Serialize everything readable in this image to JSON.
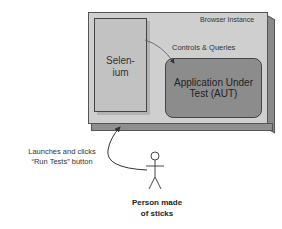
{
  "diagram": {
    "container": {
      "label": "Browser Instance"
    },
    "selenium": {
      "label": "Selen-\nium",
      "line1": "Selen-",
      "line2": "ium"
    },
    "connector": {
      "label": "Controls & Queries"
    },
    "aut": {
      "line1": "Application Under",
      "line2": "Test (AUT)"
    },
    "action": {
      "line1": "Launches and clicks",
      "line2": "“Run Tests” button"
    },
    "actor": {
      "line1": "Person made",
      "line2": "of sticks",
      "icon": "stick-figure-icon"
    },
    "colors": {
      "container": "#cfcfcf",
      "selenium": "#c2c2c2",
      "aut": "#8c8c8c"
    }
  }
}
